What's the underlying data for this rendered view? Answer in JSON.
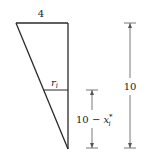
{
  "diagram": {
    "top_width_label": "4",
    "height_label": "10",
    "radius_label_base": "r",
    "radius_label_sub": "i",
    "partial_height_label_prefix": "10 − ",
    "partial_height_label_var": "x",
    "partial_height_label_sub": "i",
    "partial_height_label_sup": "*",
    "colors": {
      "stroke": "#2a2a2a",
      "dimension": "#555555",
      "background": "#ffffff"
    }
  }
}
